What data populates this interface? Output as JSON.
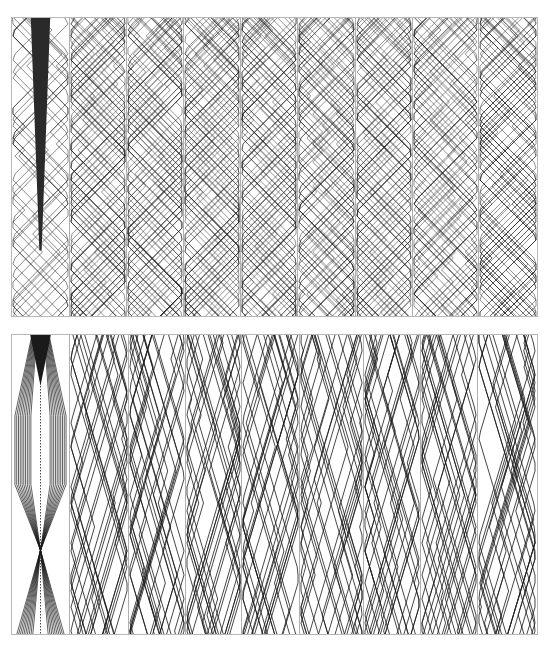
{
  "figure": {
    "panels": [
      {
        "id": "top",
        "columns": 9,
        "style": "dense-diamond-lattice",
        "first_column_feature": "tapering-black-bar",
        "column_widths": [
          58,
          57,
          57,
          57,
          57,
          58,
          57,
          66,
          58
        ]
      },
      {
        "id": "bottom",
        "columns": 9,
        "style": "sparse-long-strands",
        "first_column_feature": "black-triangle-with-fanning-bands",
        "column_widths": [
          58,
          59,
          57,
          56,
          58,
          64,
          57,
          57,
          58
        ]
      }
    ],
    "colors": {
      "line": "#1a1a1a",
      "border": "#b0b0b0",
      "background": "#ffffff"
    }
  }
}
